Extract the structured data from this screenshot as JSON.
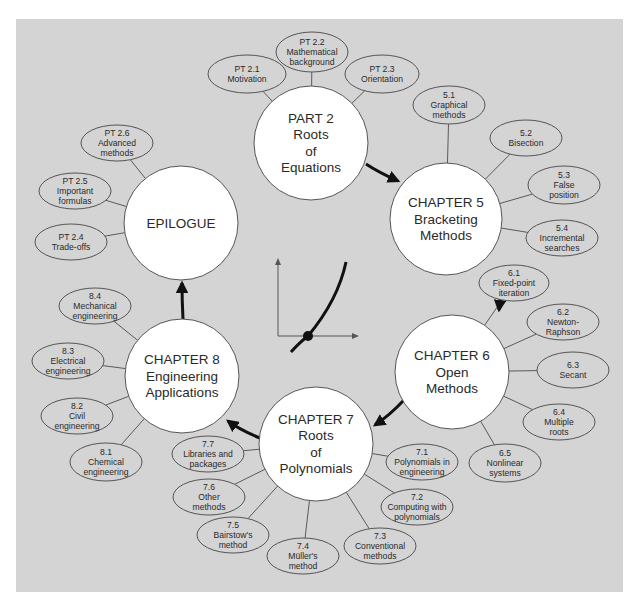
{
  "diagram": {
    "colors": {
      "panel": "#d4d4d4",
      "hub_fill": "#ffffff",
      "outline": "#555555",
      "arrow": "#111111",
      "text": "#2a2a2a"
    },
    "hubs": [
      {
        "id": "part2",
        "lines": [
          "PART 2",
          "Roots",
          "of",
          "Equations"
        ],
        "leaves": [
          {
            "id": "pt2-1",
            "lines": [
              "PT 2.1",
              "Motivation"
            ]
          },
          {
            "id": "pt2-2",
            "lines": [
              "PT 2.2",
              "Mathematical",
              "background"
            ]
          },
          {
            "id": "pt2-3",
            "lines": [
              "PT 2.3",
              "Orientation"
            ]
          }
        ]
      },
      {
        "id": "chapter5",
        "lines": [
          "CHAPTER 5",
          "Bracketing",
          "Methods"
        ],
        "leaves": [
          {
            "id": "5-1",
            "lines": [
              "5.1",
              "Graphical",
              "methods"
            ]
          },
          {
            "id": "5-2",
            "lines": [
              "5.2",
              "Bisection"
            ]
          },
          {
            "id": "5-3",
            "lines": [
              "5.3",
              "False",
              "position"
            ]
          },
          {
            "id": "5-4",
            "lines": [
              "5.4",
              "Incremental",
              "searches"
            ]
          }
        ]
      },
      {
        "id": "chapter6",
        "lines": [
          "CHAPTER 6",
          "Open",
          "Methods"
        ],
        "leaves": [
          {
            "id": "6-1",
            "lines": [
              "6.1",
              "Fixed-point",
              "iteration"
            ]
          },
          {
            "id": "6-2",
            "lines": [
              "6.2",
              "Newton-",
              "Raphson"
            ]
          },
          {
            "id": "6-3",
            "lines": [
              "6.3",
              "Secant"
            ]
          },
          {
            "id": "6-4",
            "lines": [
              "6.4",
              "Multiple",
              "roots"
            ]
          },
          {
            "id": "6-5",
            "lines": [
              "6.5",
              "Nonlinear",
              "systems"
            ]
          }
        ]
      },
      {
        "id": "chapter7",
        "lines": [
          "CHAPTER 7",
          "Roots",
          "of",
          "Polynomials"
        ],
        "leaves": [
          {
            "id": "7-1",
            "lines": [
              "7.1",
              "Polynomials in",
              "engineering"
            ]
          },
          {
            "id": "7-2",
            "lines": [
              "7.2",
              "Computing with",
              "polynomials"
            ]
          },
          {
            "id": "7-3",
            "lines": [
              "7.3",
              "Conventional",
              "methods"
            ]
          },
          {
            "id": "7-4",
            "lines": [
              "7.4",
              "Müller's",
              "method"
            ]
          },
          {
            "id": "7-5",
            "lines": [
              "7.5",
              "Bairstow's",
              "method"
            ]
          },
          {
            "id": "7-6",
            "lines": [
              "7.6",
              "Other",
              "methods"
            ]
          },
          {
            "id": "7-7",
            "lines": [
              "7.7",
              "Libraries and",
              "packages"
            ]
          }
        ]
      },
      {
        "id": "chapter8",
        "lines": [
          "CHAPTER 8",
          "Engineering",
          "Applications"
        ],
        "leaves": [
          {
            "id": "8-1",
            "lines": [
              "8.1",
              "Chemical",
              "engineering"
            ]
          },
          {
            "id": "8-2",
            "lines": [
              "8.2",
              "Civil",
              "engineering"
            ]
          },
          {
            "id": "8-3",
            "lines": [
              "8.3",
              "Electrical",
              "engineering"
            ]
          },
          {
            "id": "8-4",
            "lines": [
              "8.4",
              "Mechanical",
              "engineering"
            ]
          }
        ]
      },
      {
        "id": "epilogue",
        "lines": [
          "EPILOGUE"
        ],
        "leaves": [
          {
            "id": "pt2-4",
            "lines": [
              "PT 2.4",
              "Trade-offs"
            ]
          },
          {
            "id": "pt2-5",
            "lines": [
              "PT 2.5",
              "Important",
              "formulas"
            ]
          },
          {
            "id": "pt2-6",
            "lines": [
              "PT 2.6",
              "Advanced",
              "methods"
            ]
          }
        ]
      }
    ],
    "flow": [
      "part2",
      "chapter5",
      "chapter6",
      "chapter7",
      "chapter8",
      "epilogue"
    ],
    "center_icon": "root-of-function-graph-icon"
  }
}
